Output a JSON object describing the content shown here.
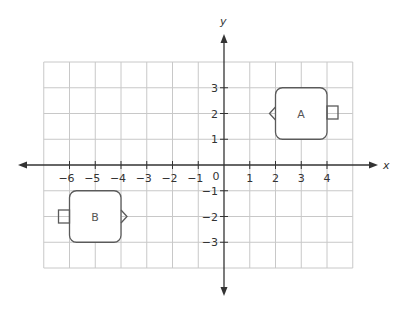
{
  "diagram": {
    "type": "coordinate-plane",
    "axes": {
      "x_label": "x",
      "y_label": "y",
      "origin_label": "0",
      "x_ticks": [
        "-6",
        "-5",
        "-4",
        "-3",
        "-2",
        "-1",
        "1",
        "2",
        "3",
        "4"
      ],
      "y_ticks": [
        "3",
        "2",
        "1",
        "-1",
        "-2",
        "-3"
      ],
      "x_grid_range": [
        -7,
        5
      ],
      "y_grid_range": [
        -4,
        4
      ]
    },
    "shapes": [
      {
        "id": "A",
        "label": "A",
        "body": {
          "x_min": 2,
          "x_max": 4,
          "y_min": 1,
          "y_max": 3
        },
        "left_feature": "triangle-pointing-left",
        "right_feature": "small-square"
      },
      {
        "id": "B",
        "label": "B",
        "body": {
          "x_min": -6,
          "x_max": -4,
          "y_min": -3,
          "y_max": -1
        },
        "left_feature": "small-square",
        "right_feature": "triangle-pointing-right"
      }
    ],
    "colors": {
      "grid": "#c8c8c8",
      "axis": "#333333",
      "shape_stroke": "#5a5a5a",
      "text": "#333333"
    }
  }
}
